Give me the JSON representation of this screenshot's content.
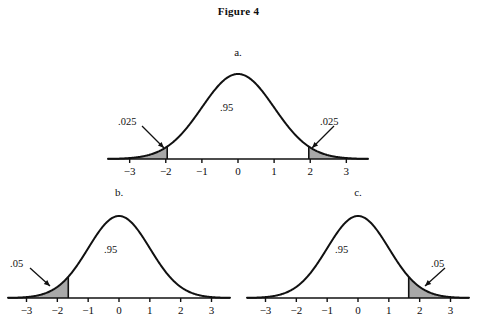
{
  "figure": {
    "title": "Figure 4"
  },
  "chart_data": {
    "type": "line",
    "title": "Figure 4",
    "xlabel": "",
    "ylabel": "",
    "xlim": [
      -3.6,
      3.6
    ],
    "grid": false,
    "legend": false,
    "panels": [
      {
        "id": "a",
        "letter": "a.",
        "tail": "two-tailed",
        "center_label": ".95",
        "center_value": 0.95,
        "tick_labels": [
          "−3",
          "−2",
          "−1",
          "0",
          "1",
          "2",
          "3"
        ],
        "tick_values": [
          -3,
          -2,
          -1,
          0,
          1,
          2,
          3
        ],
        "regions": [
          {
            "label": ".025",
            "value": 0.025,
            "side": "left",
            "cutoff": -1.96
          },
          {
            "label": ".95",
            "value": 0.95,
            "side": "center",
            "cutoff": 0
          },
          {
            "label": ".025",
            "value": 0.025,
            "side": "right",
            "cutoff": 1.96
          }
        ]
      },
      {
        "id": "b",
        "letter": "b.",
        "tail": "left-tailed",
        "center_label": ".95",
        "center_value": 0.95,
        "tick_labels": [
          "−3",
          "−2",
          "−1",
          "0",
          "1",
          "2",
          "3"
        ],
        "tick_values": [
          -3,
          -2,
          -1,
          0,
          1,
          2,
          3
        ],
        "regions": [
          {
            "label": ".05",
            "value": 0.05,
            "side": "left",
            "cutoff": -1.645
          },
          {
            "label": ".95",
            "value": 0.95,
            "side": "center",
            "cutoff": 0
          }
        ]
      },
      {
        "id": "c",
        "letter": "c.",
        "tail": "right-tailed",
        "center_label": ".95",
        "center_value": 0.95,
        "tick_labels": [
          "−3",
          "−2",
          "−1",
          "0",
          "1",
          "2",
          "3"
        ],
        "tick_values": [
          -3,
          -2,
          -1,
          0,
          1,
          2,
          3
        ],
        "regions": [
          {
            "label": ".95",
            "value": 0.95,
            "side": "center",
            "cutoff": 0
          },
          {
            "label": ".05",
            "value": 0.05,
            "side": "right",
            "cutoff": 1.645
          }
        ]
      }
    ]
  },
  "style": {
    "curve_color": "#111111",
    "shade_fill": "#a8a8a8",
    "axis_color": "#111111",
    "background": "#ffffff"
  }
}
